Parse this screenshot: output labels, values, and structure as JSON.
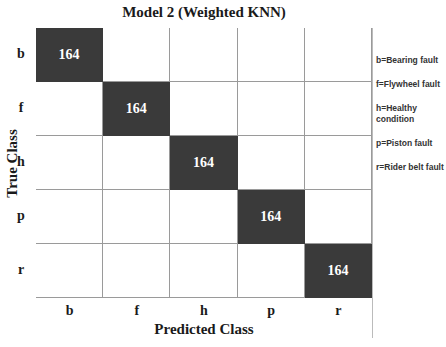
{
  "chart_data": {
    "type": "heatmap",
    "title": "Model 2 (Weighted KNN)",
    "xlabel": "Predicted Class",
    "ylabel": "True Class",
    "x_categories": [
      "b",
      "f",
      "h",
      "p",
      "r"
    ],
    "y_categories": [
      "b",
      "f",
      "h",
      "p",
      "r"
    ],
    "values": [
      [
        164,
        0,
        0,
        0,
        0
      ],
      [
        0,
        164,
        0,
        0,
        0
      ],
      [
        0,
        0,
        164,
        0,
        0
      ],
      [
        0,
        0,
        0,
        164,
        0
      ],
      [
        0,
        0,
        0,
        0,
        164
      ]
    ],
    "legend": [
      "b=Bearing fault",
      "f=Flywheel fault",
      "h=Healthy condition",
      "p=Piston fault",
      "r=Rider belt fault"
    ],
    "colors": {
      "hit": "#3a3a3a",
      "empty": "#ffffff",
      "grid": "#9a9a9a"
    }
  }
}
